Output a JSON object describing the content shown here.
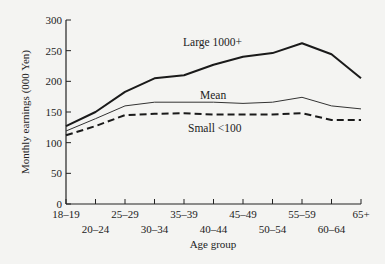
{
  "chart_data": {
    "type": "line",
    "title": "",
    "xlabel": "Age group",
    "ylabel": "Monthly earnings (000 Yen)",
    "ylim": [
      0,
      300
    ],
    "yticks": [
      0,
      50,
      100,
      150,
      200,
      250,
      300
    ],
    "grid": false,
    "legend": "inline labels on lines",
    "categories": [
      "18–19",
      "20–24",
      "25–29",
      "30–34",
      "35–39",
      "40–44",
      "45–49",
      "50–54",
      "55–59",
      "60–64",
      "65+"
    ],
    "series": [
      {
        "name": "Large 1000+",
        "style": "solid-thick",
        "values": [
          127,
          150,
          183,
          205,
          210,
          227,
          240,
          246,
          262,
          244,
          205
        ]
      },
      {
        "name": "Mean",
        "style": "solid-thin",
        "values": [
          119,
          139,
          160,
          166,
          166,
          166,
          164,
          166,
          174,
          160,
          155
        ]
      },
      {
        "name": "Small <100",
        "style": "dashed-thick",
        "values": [
          112,
          127,
          145,
          147,
          148,
          146,
          146,
          146,
          148,
          137,
          137
        ]
      }
    ]
  },
  "labels": {
    "large": "Large 1000+",
    "mean": "Mean",
    "small": "Small <100",
    "xlabel": "Age group",
    "ylabel": "Monthly earnings (000 Yen)"
  }
}
